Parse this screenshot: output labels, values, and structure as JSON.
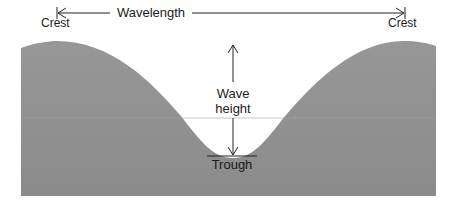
{
  "diagram": {
    "labels": {
      "crest_left": "Crest",
      "crest_right": "Crest",
      "wavelength": "Wavelength",
      "wave_height_line1": "Wave",
      "wave_height_line2": "height",
      "trough": "Trough"
    },
    "colors": {
      "wave_fill_top": "#949494",
      "wave_fill_bottom": "#8a8a8a",
      "line": "#222222",
      "background": "#ffffff",
      "text": "#1a1a1a"
    }
  }
}
